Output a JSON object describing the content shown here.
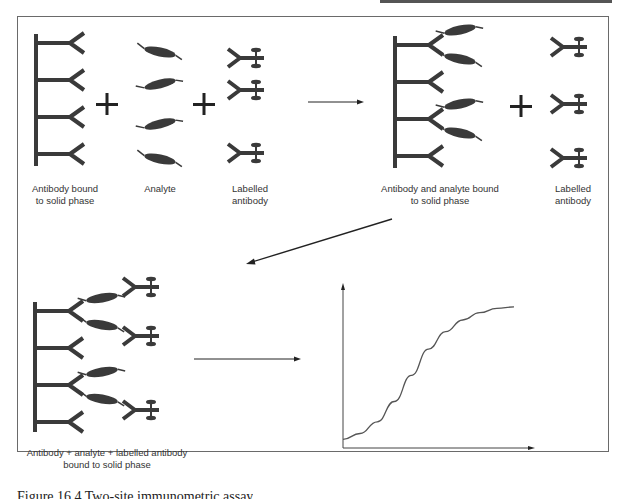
{
  "figure": {
    "panels": [
      {
        "id": "reactant-1",
        "label": "Antibody bound\nto solid phase"
      },
      {
        "id": "reactant-2",
        "label": "Analyte"
      },
      {
        "id": "reactant-3",
        "label": "Labelled\nantibody"
      },
      {
        "id": "intermediate",
        "label": "Antibody and analyte bound\nto solid phase"
      },
      {
        "id": "reactant-4",
        "label": "Labelled\nantibody"
      },
      {
        "id": "product",
        "label": "Antibody + analyte + labelled antibody\nbound to solid phase"
      }
    ],
    "operators": {
      "plus": "+"
    },
    "colors": {
      "ink": "#3a3a3a",
      "frame": "#6a6a6a",
      "curve": "#555555"
    },
    "caption": "Figure 16.4  Two-site immunometric assay"
  },
  "chart_data": {
    "type": "line",
    "title": "",
    "xlabel": "",
    "ylabel": "",
    "grid": false,
    "legend": "none",
    "x": [
      0,
      0.1,
      0.2,
      0.3,
      0.4,
      0.5,
      0.6,
      0.7,
      0.8,
      0.9,
      1.0
    ],
    "series": [
      {
        "name": "response",
        "values": [
          0.06,
          0.1,
          0.18,
          0.32,
          0.5,
          0.68,
          0.8,
          0.88,
          0.93,
          0.96,
          0.97
        ]
      }
    ],
    "xlim": [
      0,
      1.1
    ],
    "ylim": [
      0,
      1.1
    ]
  }
}
